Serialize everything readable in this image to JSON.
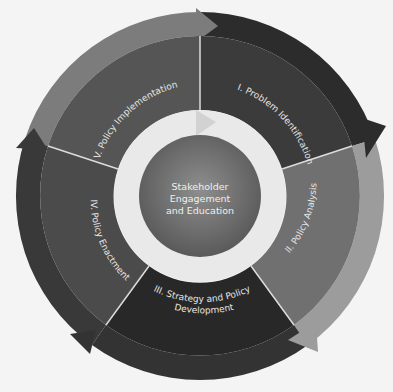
{
  "diagram": {
    "center": {
      "lines": [
        "Stakeholder",
        "Engagement",
        "and Education"
      ]
    },
    "stages": [
      {
        "id": "I",
        "label": "I. Problem Identification"
      },
      {
        "id": "II",
        "label": "II. Policy  Analysis"
      },
      {
        "id": "III",
        "label_line1": "III. Strategy and Policy",
        "label_line2": "Development"
      },
      {
        "id": "IV",
        "label": "IV. Policy Enactment"
      },
      {
        "id": "V",
        "label": "V. Policy Implementation"
      }
    ],
    "colors": {
      "stage_I": "#3b3b3b",
      "stage_I_band": "#2c2c2c",
      "stage_II": "#707070",
      "stage_II_band": "#9c9c9c",
      "stage_III": "#282828",
      "stage_III_band": "#333333",
      "stage_IV": "#4b4b4b",
      "stage_IV_band": "#393939",
      "stage_V": "#555555",
      "stage_V_band": "#7c7c7c",
      "inner_ring": "#e9e9e9",
      "center_light": "#8c8c8c",
      "center_dark": "#565656",
      "label_text": "#e6e6e6"
    }
  }
}
